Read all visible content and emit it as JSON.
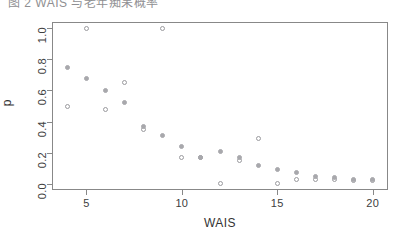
{
  "top_caption": {
    "clipped_text": "图 2  WAIS 与老年痴呆概率"
  },
  "axis_titles": {
    "x": "WAIS",
    "y": "p"
  },
  "chart_data": {
    "type": "scatter",
    "title": "",
    "subtitle": "",
    "xlabel": "WAIS",
    "ylabel": "p",
    "xlim": [
      3.2,
      20.8
    ],
    "ylim": [
      -0.04,
      1.04
    ],
    "xticks": [
      5,
      10,
      15,
      20
    ],
    "xtick_labels": [
      "5",
      "10",
      "15",
      "20"
    ],
    "yticks": [
      0.0,
      0.2,
      0.4,
      0.6,
      0.8,
      1.0
    ],
    "ytick_labels": [
      "0.0",
      "0.2",
      "0.4",
      "0.6",
      "0.8",
      "1.0"
    ],
    "grid": false,
    "legend": "none",
    "series": [
      {
        "name": "observed",
        "marker": "open-circle",
        "color": "#9a9a9e",
        "x": [
          4,
          5,
          6,
          7,
          8,
          9,
          10,
          11,
          12,
          13,
          14,
          15,
          16,
          17,
          18,
          19,
          20
        ],
        "values": [
          0.5,
          1.0,
          0.48,
          0.65,
          0.35,
          1.0,
          0.17,
          0.17,
          0.0,
          0.15,
          0.29,
          0.0,
          0.03,
          0.03,
          0.03,
          0.02,
          0.02
        ]
      },
      {
        "name": "fitted",
        "marker": "filled-circle",
        "color": "#a8a8ac",
        "x": [
          4,
          5,
          6,
          7,
          8,
          9,
          10,
          11,
          12,
          13,
          14,
          15,
          16,
          17,
          18,
          19,
          20
        ],
        "values": [
          0.75,
          0.68,
          0.6,
          0.52,
          0.37,
          0.31,
          0.24,
          0.17,
          0.21,
          0.17,
          0.12,
          0.09,
          0.07,
          0.05,
          0.04,
          0.03,
          0.03
        ]
      }
    ]
  }
}
